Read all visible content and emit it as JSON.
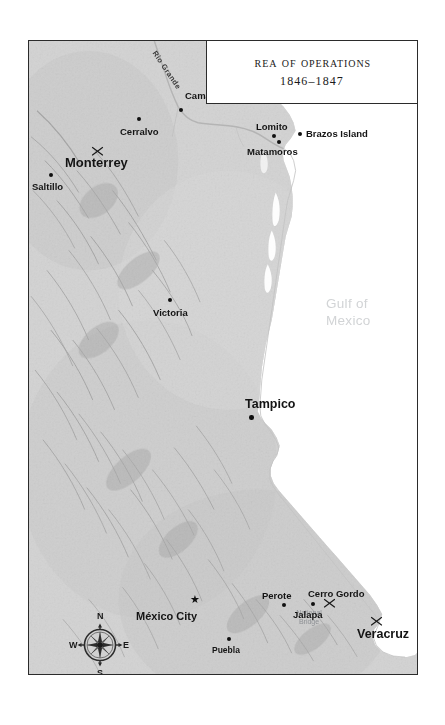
{
  "figure": {
    "kind": "historical-map",
    "title_main": "Area of Operations",
    "title_dates": "1846–1847"
  },
  "colors": {
    "land": "#cfcfcf",
    "land_light": "#dcdcdc",
    "ocean": "#ffffff",
    "frame": "#2b2b2b",
    "label": "#141414",
    "water_label": "#d2d4d6",
    "gray_label": "#8d9094",
    "relief": "#9a9a9a",
    "river": "#b0b0b0"
  },
  "water_features": [
    {
      "name": "gulf-of-mexico",
      "line1": "Gulf of",
      "line2": "Mexico",
      "x": 327,
      "y": 297
    }
  ],
  "rivers": [
    {
      "name": "rio-grande",
      "label": "Rio Grande",
      "x": 157,
      "y": 48,
      "rotate": 56
    }
  ],
  "annotations": [
    {
      "name": "national-bridge",
      "line1": "National",
      "line2": "Bridge",
      "x": 300,
      "y": 612
    }
  ],
  "places": [
    {
      "name": "camargo",
      "label": "Camargo",
      "size": "md",
      "lx": 184,
      "ly": 94,
      "dx": 178,
      "dy": 107,
      "anchor": "left",
      "marker": "dot",
      "battle": false
    },
    {
      "name": "cerralvo",
      "label": "Cerralvo",
      "size": "md",
      "lx": 119,
      "ly": 126,
      "dx": 136,
      "dy": 116,
      "anchor": "left",
      "marker": "dot",
      "battle": false
    },
    {
      "name": "lomito",
      "label": "Lomito",
      "size": "md",
      "lx": 255,
      "ly": 121,
      "dx": 271,
      "dy": 133,
      "anchor": "left",
      "marker": "dot",
      "battle": false
    },
    {
      "name": "brazos-island",
      "label": "Brazos Island",
      "size": "md",
      "lx": 305,
      "ly": 130,
      "dx": 297,
      "dy": 131,
      "anchor": "left",
      "marker": "dot",
      "battle": false
    },
    {
      "name": "matamoros",
      "label": "Matamoros",
      "size": "md",
      "lx": 246,
      "ly": 146,
      "dx": 276,
      "dy": 139,
      "anchor": "left",
      "marker": "dot",
      "battle": false
    },
    {
      "name": "monterrey",
      "label": "Monterrey",
      "size": "lg",
      "lx": 64,
      "ly": 161,
      "dx": 104,
      "dy": 154,
      "anchor": "left",
      "marker": "none",
      "battle": true,
      "bx": 90,
      "by": 148
    },
    {
      "name": "saltillo",
      "label": "Saltillo",
      "size": "md",
      "lx": 31,
      "ly": 182,
      "dx": 48,
      "dy": 172,
      "anchor": "left",
      "marker": "dot",
      "battle": false
    },
    {
      "name": "victoria",
      "label": "Victoria",
      "size": "md",
      "lx": 152,
      "ly": 308,
      "dx": 167,
      "dy": 297,
      "anchor": "left",
      "marker": "dot",
      "battle": false
    },
    {
      "name": "tampico",
      "label": "Tampico",
      "size": "xl",
      "lx": 244,
      "ly": 399,
      "dx": 248,
      "dy": 414,
      "anchor": "left",
      "marker": "dot",
      "battle": false
    },
    {
      "name": "perote",
      "label": "Perote",
      "size": "md",
      "lx": 261,
      "ly": 592,
      "dx": 281,
      "dy": 602,
      "anchor": "left",
      "marker": "dot",
      "battle": false
    },
    {
      "name": "cerro-gordo",
      "label": "Cerro Gordo",
      "size": "md",
      "lx": 307,
      "ly": 590,
      "dx": 0,
      "dy": 0,
      "anchor": "left",
      "marker": "none",
      "battle": true,
      "bx": 328,
      "by": 600
    },
    {
      "name": "jalapa",
      "label": "Jalapa",
      "size": "md",
      "lx": 292,
      "ly": 610,
      "dx": 310,
      "dy": 601,
      "anchor": "left",
      "marker": "dot",
      "battle": false
    },
    {
      "name": "veracruz",
      "label": "Veracruz",
      "size": "xl",
      "lx": 356,
      "ly": 630,
      "dx": 0,
      "dy": 0,
      "anchor": "left",
      "marker": "none",
      "battle": true,
      "bx": 375,
      "by": 619
    },
    {
      "name": "mexico-city",
      "label": "México City",
      "size": "cap",
      "lx": 135,
      "ly": 616,
      "dx": 0,
      "dy": 0,
      "anchor": "left",
      "marker": "star",
      "sx": 165,
      "sy": 600,
      "battle": false
    },
    {
      "name": "puebla",
      "label": "Puebla",
      "size": "sm",
      "lx": 211,
      "ly": 648,
      "dx": 226,
      "dy": 638,
      "anchor": "left",
      "marker": "dot",
      "battle": false
    }
  ],
  "compass": {
    "north": "N",
    "south": "S",
    "east": "E",
    "west": "W"
  },
  "scale": {
    "unit_label": "100 Miles",
    "ticks": [
      "0",
      "25",
      "50"
    ],
    "tick_positions": [
      0,
      25,
      50,
      100
    ],
    "max_value": 100
  }
}
